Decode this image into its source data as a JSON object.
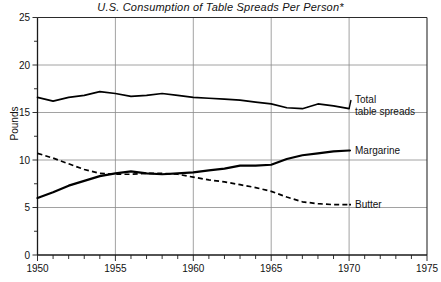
{
  "chart": {
    "title": "U.S. Consumption of Table Spreads Per Person*",
    "ylabel": "Pounds",
    "footnote": ""
  },
  "chart_data": {
    "type": "line",
    "title": "U.S. Consumption of Table Spreads Per Person*",
    "xlabel": "",
    "ylabel": "Pounds",
    "xlim": [
      1950,
      1975
    ],
    "ylim": [
      0,
      25
    ],
    "grid": true,
    "legend_position": "inline-right",
    "xticks": [
      1950,
      1955,
      1960,
      1965,
      1970,
      1975
    ],
    "xtick_labels": [
      "1950",
      "1955",
      "1960",
      "1965",
      "1970",
      "1975"
    ],
    "yticks": [
      0,
      5,
      10,
      15,
      20,
      25
    ],
    "ytick_labels": [
      "0",
      "5",
      "10",
      "15",
      "20",
      "25"
    ],
    "yminor_ticks": [
      2.5,
      7.5,
      12.5,
      17.5,
      22.5
    ],
    "xminor_ticks": [
      1951,
      1952,
      1953,
      1954,
      1956,
      1957,
      1958,
      1959,
      1961,
      1962,
      1963,
      1964,
      1966,
      1967,
      1968,
      1969,
      1971,
      1972,
      1973,
      1974
    ],
    "x": [
      1950,
      1951,
      1952,
      1953,
      1954,
      1955,
      1956,
      1957,
      1958,
      1959,
      1960,
      1961,
      1962,
      1963,
      1964,
      1965,
      1966,
      1967,
      1968,
      1969,
      1970
    ],
    "series": [
      {
        "name": "Total table spreads",
        "label": "Total\ntable spreads",
        "label_line1": "Total",
        "label_line2": "table spreads",
        "style": "solid",
        "values": [
          16.6,
          16.2,
          16.6,
          16.8,
          17.2,
          17.0,
          16.7,
          16.8,
          17.0,
          16.8,
          16.6,
          16.5,
          16.4,
          16.3,
          16.1,
          15.9,
          15.5,
          15.4,
          15.9,
          15.7,
          15.4
        ]
      },
      {
        "name": "Margarine",
        "label": "Margarine",
        "style": "solid-thick",
        "values": [
          6.0,
          6.6,
          7.3,
          7.8,
          8.3,
          8.6,
          8.8,
          8.6,
          8.5,
          8.6,
          8.7,
          8.9,
          9.1,
          9.4,
          9.4,
          9.5,
          10.1,
          10.5,
          10.7,
          10.9,
          11.0
        ]
      },
      {
        "name": "Butter",
        "label": "Butter",
        "style": "dashed",
        "values": [
          10.7,
          10.2,
          9.6,
          9.0,
          8.6,
          8.5,
          8.5,
          8.6,
          8.6,
          8.5,
          8.2,
          7.9,
          7.7,
          7.4,
          7.1,
          6.7,
          6.1,
          5.6,
          5.4,
          5.3,
          5.3
        ]
      }
    ]
  }
}
